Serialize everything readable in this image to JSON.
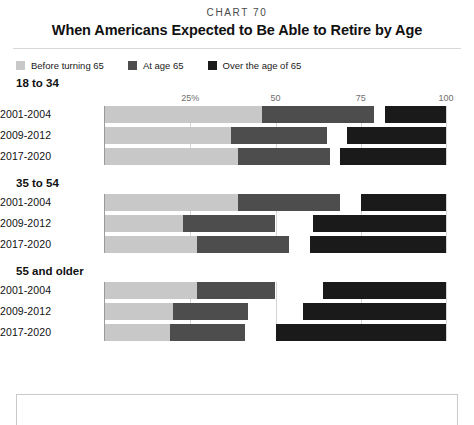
{
  "header": {
    "chart_number": "CHART 70",
    "title": "When Americans Expected to Be Able to Retire by Age"
  },
  "legend": {
    "items": [
      {
        "label": "Before turning 65",
        "color": "#c8c8c8"
      },
      {
        "label": "At age 65",
        "color": "#4d4d4d"
      },
      {
        "label": "Over the age of 65",
        "color": "#1a1a1a"
      }
    ]
  },
  "chart_data": {
    "type": "bar",
    "orientation": "horizontal",
    "stacked": true,
    "title": "When Americans Expected to Be Able to Retire by Age",
    "subtitle": "CHART 70",
    "xlabel": "",
    "ylabel": "",
    "xlim": [
      0,
      100
    ],
    "grid": true,
    "legend_position": "top-left",
    "axis_ticks": [
      "25%",
      "50",
      "75",
      "100"
    ],
    "axis_tick_values": [
      25,
      50,
      75,
      100
    ],
    "series": [
      {
        "name": "Before turning 65",
        "color": "#c8c8c8"
      },
      {
        "name": "At age 65",
        "color": "#4d4d4d"
      },
      {
        "name": "Over the age of 65",
        "color": "#1a1a1a"
      }
    ],
    "groups": [
      {
        "name": "18 to 34",
        "rows": [
          {
            "category": "2001-2004",
            "values": [
              46,
              33,
              18
            ],
            "segments": [
              {
                "start": 0,
                "end": 46
              },
              {
                "start": 46,
                "end": 79
              },
              {
                "start": 82,
                "end": 100
              }
            ]
          },
          {
            "category": "2009-2012",
            "values": [
              37,
              28,
              29
            ],
            "segments": [
              {
                "start": 0,
                "end": 37
              },
              {
                "start": 37,
                "end": 65
              },
              {
                "start": 71,
                "end": 100
              }
            ]
          },
          {
            "category": "2017-2020",
            "values": [
              39,
              27,
              31
            ],
            "segments": [
              {
                "start": 0,
                "end": 39
              },
              {
                "start": 39,
                "end": 66
              },
              {
                "start": 69,
                "end": 100
              }
            ]
          }
        ]
      },
      {
        "name": "35 to 54",
        "rows": [
          {
            "category": "2001-2004",
            "values": [
              39,
              30,
              25
            ],
            "segments": [
              {
                "start": 0,
                "end": 39
              },
              {
                "start": 39,
                "end": 69
              },
              {
                "start": 75,
                "end": 100
              }
            ]
          },
          {
            "category": "2009-2012",
            "values": [
              23,
              27,
              39
            ],
            "segments": [
              {
                "start": 0,
                "end": 23
              },
              {
                "start": 23,
                "end": 50
              },
              {
                "start": 61,
                "end": 100
              }
            ]
          },
          {
            "category": "2017-2020",
            "values": [
              27,
              27,
              40
            ],
            "segments": [
              {
                "start": 0,
                "end": 27
              },
              {
                "start": 27,
                "end": 54
              },
              {
                "start": 60,
                "end": 100
              }
            ]
          }
        ]
      },
      {
        "name": "55 and older",
        "rows": [
          {
            "category": "2001-2004",
            "values": [
              27,
              23,
              36
            ],
            "segments": [
              {
                "start": 0,
                "end": 27
              },
              {
                "start": 27,
                "end": 50
              },
              {
                "start": 64,
                "end": 100
              }
            ]
          },
          {
            "category": "2009-2012",
            "values": [
              20,
              22,
              42
            ],
            "segments": [
              {
                "start": 0,
                "end": 20
              },
              {
                "start": 20,
                "end": 42
              },
              {
                "start": 58,
                "end": 100
              }
            ]
          },
          {
            "category": "2017-2020",
            "values": [
              19,
              22,
              50
            ],
            "segments": [
              {
                "start": 0,
                "end": 19
              },
              {
                "start": 19,
                "end": 41
              },
              {
                "start": 50,
                "end": 100
              }
            ]
          }
        ]
      }
    ]
  }
}
